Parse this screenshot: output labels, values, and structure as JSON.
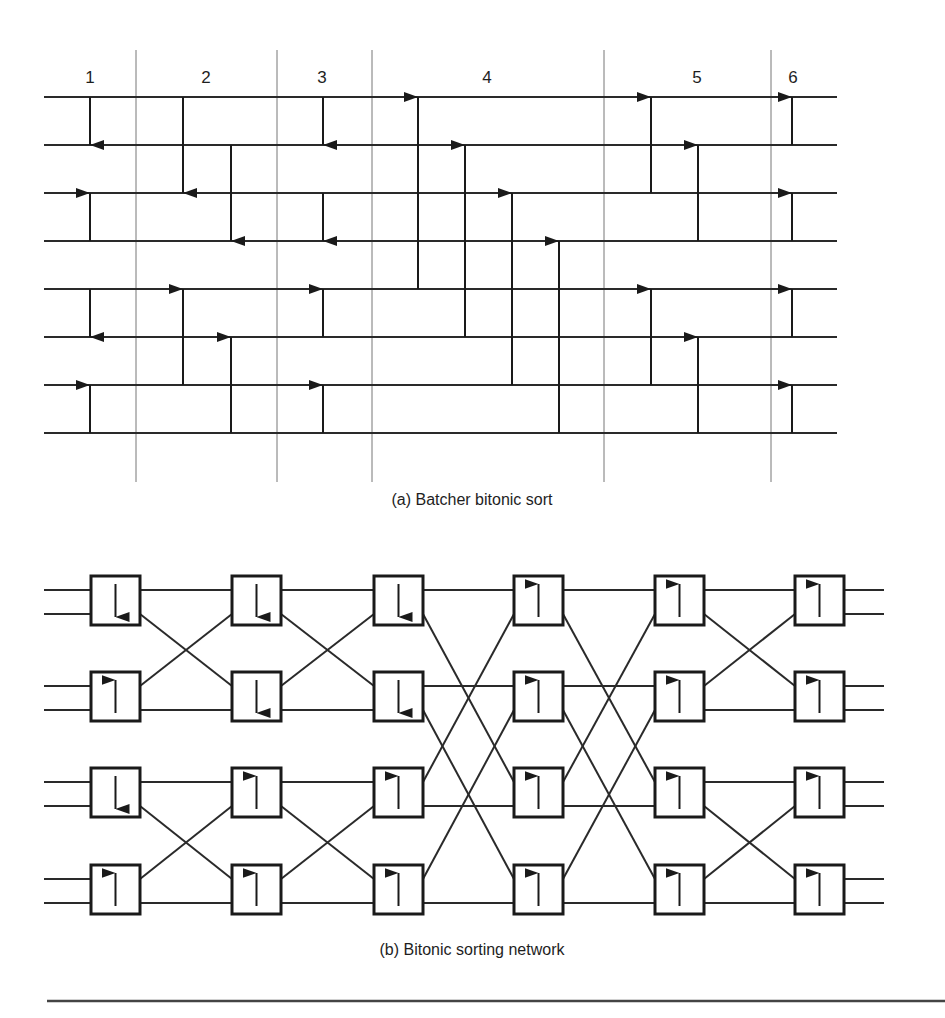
{
  "figure_a": {
    "caption": "(a) Batcher bitonic sort",
    "column_labels": [
      {
        "text": "1",
        "x": 90
      },
      {
        "text": "2",
        "x": 206
      },
      {
        "text": "3",
        "x": 322
      },
      {
        "text": "4",
        "x": 487
      },
      {
        "text": "5",
        "x": 697
      },
      {
        "text": "6",
        "x": 793
      }
    ],
    "dividers_x": [
      136,
      277,
      372,
      604,
      771
    ],
    "divider_y": [
      50,
      482
    ],
    "wires_y": [
      97,
      145,
      193,
      241,
      289,
      337,
      385,
      433
    ],
    "wire_x": [
      44,
      837
    ],
    "comparators": [
      {
        "x": 90,
        "from": 0,
        "to": 1,
        "dir": "down"
      },
      {
        "x": 90,
        "from": 2,
        "to": 3,
        "dir": "up"
      },
      {
        "x": 90,
        "from": 4,
        "to": 5,
        "dir": "down"
      },
      {
        "x": 90,
        "from": 6,
        "to": 7,
        "dir": "up"
      },
      {
        "x": 183,
        "from": 0,
        "to": 2,
        "dir": "down"
      },
      {
        "x": 231,
        "from": 1,
        "to": 3,
        "dir": "down"
      },
      {
        "x": 183,
        "from": 4,
        "to": 6,
        "dir": "up"
      },
      {
        "x": 231,
        "from": 5,
        "to": 7,
        "dir": "up"
      },
      {
        "x": 323,
        "from": 0,
        "to": 1,
        "dir": "down"
      },
      {
        "x": 323,
        "from": 2,
        "to": 3,
        "dir": "down"
      },
      {
        "x": 323,
        "from": 4,
        "to": 5,
        "dir": "up"
      },
      {
        "x": 323,
        "from": 6,
        "to": 7,
        "dir": "up"
      },
      {
        "x": 418,
        "from": 0,
        "to": 4,
        "dir": "up"
      },
      {
        "x": 465,
        "from": 1,
        "to": 5,
        "dir": "up"
      },
      {
        "x": 512,
        "from": 2,
        "to": 6,
        "dir": "up"
      },
      {
        "x": 559,
        "from": 3,
        "to": 7,
        "dir": "up"
      },
      {
        "x": 651,
        "from": 0,
        "to": 2,
        "dir": "up"
      },
      {
        "x": 698,
        "from": 1,
        "to": 3,
        "dir": "up"
      },
      {
        "x": 651,
        "from": 4,
        "to": 6,
        "dir": "up"
      },
      {
        "x": 698,
        "from": 5,
        "to": 7,
        "dir": "up"
      },
      {
        "x": 792,
        "from": 0,
        "to": 1,
        "dir": "up"
      },
      {
        "x": 792,
        "from": 2,
        "to": 3,
        "dir": "up"
      },
      {
        "x": 792,
        "from": 4,
        "to": 5,
        "dir": "up"
      },
      {
        "x": 792,
        "from": 6,
        "to": 7,
        "dir": "up"
      }
    ]
  },
  "figure_b": {
    "caption": "(b) Bitonic sorting network",
    "box_size": 49,
    "columns_x": [
      91,
      232,
      374,
      514,
      655,
      795
    ],
    "rows_y": [
      576,
      672,
      768,
      865
    ],
    "port_offsets": [
      14,
      38
    ],
    "input_x": 44,
    "output_x": 884,
    "boxes": [
      [
        "down",
        "up",
        "down",
        "up"
      ],
      [
        "down",
        "down",
        "up",
        "up"
      ],
      [
        "down",
        "down",
        "up",
        "up"
      ],
      [
        "up",
        "up",
        "up",
        "up"
      ],
      [
        "up",
        "up",
        "up",
        "up"
      ],
      [
        "up",
        "up",
        "up",
        "up"
      ]
    ],
    "stage_wiring": [
      [
        [
          0,
          0
        ],
        [
          1,
          2
        ],
        [
          2,
          1
        ],
        [
          3,
          3
        ],
        [
          4,
          4
        ],
        [
          5,
          6
        ],
        [
          6,
          5
        ],
        [
          7,
          7
        ]
      ],
      [
        [
          0,
          0
        ],
        [
          1,
          2
        ],
        [
          2,
          1
        ],
        [
          3,
          3
        ],
        [
          4,
          4
        ],
        [
          5,
          6
        ],
        [
          6,
          5
        ],
        [
          7,
          7
        ]
      ],
      [
        [
          0,
          0
        ],
        [
          1,
          4
        ],
        [
          2,
          2
        ],
        [
          3,
          6
        ],
        [
          4,
          1
        ],
        [
          5,
          5
        ],
        [
          6,
          3
        ],
        [
          7,
          7
        ]
      ],
      [
        [
          0,
          0
        ],
        [
          1,
          4
        ],
        [
          2,
          2
        ],
        [
          3,
          6
        ],
        [
          4,
          1
        ],
        [
          5,
          5
        ],
        [
          6,
          3
        ],
        [
          7,
          7
        ]
      ],
      [
        [
          0,
          0
        ],
        [
          1,
          2
        ],
        [
          2,
          1
        ],
        [
          3,
          3
        ],
        [
          4,
          4
        ],
        [
          5,
          6
        ],
        [
          6,
          5
        ],
        [
          7,
          7
        ]
      ]
    ]
  },
  "rule": {
    "y": 1001,
    "x1": 47,
    "x2": 945
  }
}
